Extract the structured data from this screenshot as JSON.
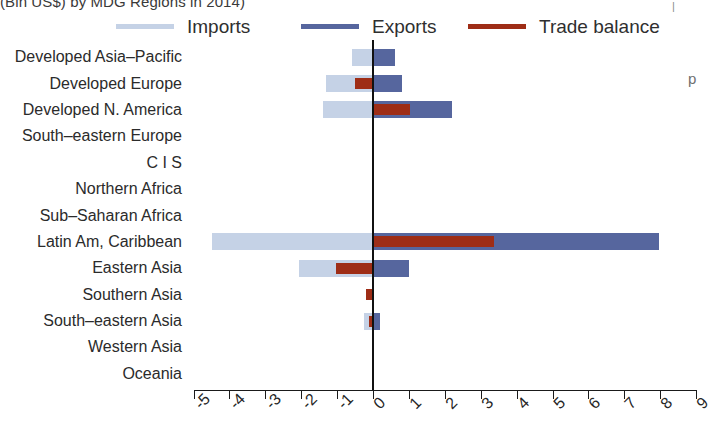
{
  "chart_data": {
    "type": "bar",
    "orientation": "horizontal",
    "title": "(Bln US$) by MDG Regions in 2014)",
    "xlabel": "",
    "ylabel": "",
    "xlim": [
      -5,
      9
    ],
    "grid": false,
    "legend_position": "top",
    "zero_reference_line": true,
    "categories": [
      "Developed Asia–Pacific",
      "Developed Europe",
      "Developed N. America",
      "South–eastern Europe",
      "C I S",
      "Northern Africa",
      "Sub–Saharan Africa",
      "Latin Am, Caribbean",
      "Eastern Asia",
      "Southern Asia",
      "South–eastern Asia",
      "Western Asia",
      "Oceania"
    ],
    "xticks": [
      -5,
      -4,
      -3,
      -2,
      -1,
      0,
      1,
      2,
      3,
      4,
      5,
      6,
      7,
      8,
      9
    ],
    "xtick_labels": [
      "-5",
      "-4",
      "-3",
      "-2",
      "-1",
      "0",
      "1",
      "2",
      "3",
      "4",
      "5",
      "6",
      "7",
      "8",
      "9"
    ],
    "series": [
      {
        "name": "Imports",
        "color": "#c5d2e6",
        "values": [
          -0.58,
          -1.3,
          -1.38,
          0,
          0,
          0,
          0,
          -4.48,
          -2.05,
          0,
          -0.25,
          0,
          0
        ]
      },
      {
        "name": "Exports",
        "color": "#56669e",
        "values": [
          0.62,
          0.82,
          2.2,
          0,
          0,
          0,
          0,
          7.98,
          1.0,
          0,
          0.2,
          0,
          0
        ]
      },
      {
        "name": "Trade balance",
        "color": "#9e2d16",
        "values": [
          0,
          -0.5,
          1.02,
          0,
          0,
          0,
          0,
          3.38,
          -1.02,
          -0.2,
          -0.12,
          0,
          0
        ]
      }
    ]
  },
  "legend": {
    "items": [
      {
        "label": "Imports",
        "color": "#c5d2e6"
      },
      {
        "label": "Exports",
        "color": "#56669e"
      },
      {
        "label": "Trade balance",
        "color": "#9e2d16"
      }
    ]
  },
  "artifacts": {
    "stray_letter": "p",
    "stray_tick": "|"
  }
}
